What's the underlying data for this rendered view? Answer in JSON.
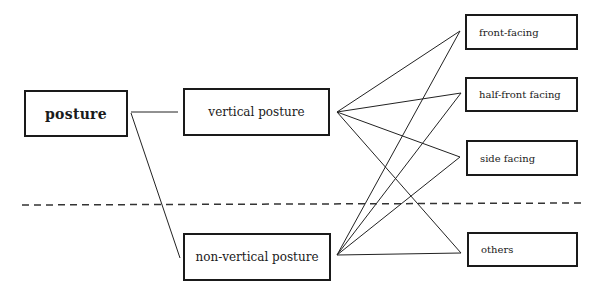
{
  "diagram": {
    "root": {
      "label": "posture"
    },
    "categories": [
      {
        "id": "vertical",
        "label": "vertical posture"
      },
      {
        "id": "non_vertical",
        "label": "non-vertical posture"
      }
    ],
    "facings": [
      {
        "id": "front",
        "label": "front-facing"
      },
      {
        "id": "half_front",
        "label": "half-front facing"
      },
      {
        "id": "side",
        "label": "side facing"
      },
      {
        "id": "others",
        "label": "others"
      }
    ],
    "edges": [
      [
        "posture",
        "vertical"
      ],
      [
        "posture",
        "non_vertical"
      ],
      [
        "vertical",
        "front"
      ],
      [
        "vertical",
        "half_front"
      ],
      [
        "vertical",
        "side"
      ],
      [
        "vertical",
        "others"
      ],
      [
        "non_vertical",
        "front"
      ],
      [
        "non_vertical",
        "half_front"
      ],
      [
        "non_vertical",
        "side"
      ],
      [
        "non_vertical",
        "others"
      ]
    ],
    "separator": "dashed horizontal line"
  }
}
